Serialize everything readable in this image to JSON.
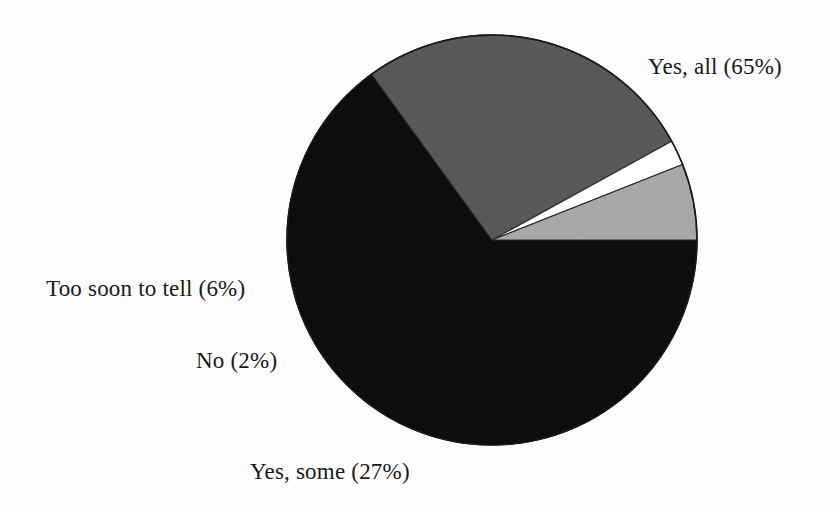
{
  "chart_data": {
    "type": "pie",
    "title": "",
    "subtitle": "",
    "xlabel": "",
    "ylabel": "",
    "legend_position": "none",
    "grid": false,
    "labels_inline": true,
    "unit": "%",
    "categories": [
      "Yes, all",
      "Yes, some",
      "No",
      "Too soon to tell"
    ],
    "values": [
      65,
      27,
      2,
      6
    ],
    "slices": [
      {
        "name": "yes-all",
        "label": "Yes, all (65%)",
        "category": "Yes, all",
        "value": 65,
        "color": "#0d0d0d",
        "start_angle_deg": 0,
        "end_angle_deg": 234
      },
      {
        "name": "yes-some",
        "label": "Yes, some (27%)",
        "category": "Yes, some",
        "value": 27,
        "color": "#595959",
        "start_angle_deg": 234,
        "end_angle_deg": 331.2
      },
      {
        "name": "no",
        "label": "No (2%)",
        "category": "No",
        "value": 2,
        "color": "#ffffff",
        "start_angle_deg": 331.2,
        "end_angle_deg": 338.4
      },
      {
        "name": "too-soon-to-tell",
        "label": "Too soon to tell (6%)",
        "category": "Too soon to tell",
        "value": 6,
        "color": "#a8a8a8",
        "start_angle_deg": 338.4,
        "end_angle_deg": 360
      }
    ],
    "geometry": {
      "center_x": 492,
      "center_y": 240,
      "radius": 205,
      "start_angle_deg": 0,
      "direction": "clockwise"
    },
    "colors": {
      "background": "#fdfdfd",
      "outline": "#1a1a1a",
      "text": "#1a1a1a",
      "yes_all": "#0d0d0d",
      "yes_some": "#595959",
      "no": "#ffffff",
      "too_soon_to_tell": "#a8a8a8"
    }
  }
}
